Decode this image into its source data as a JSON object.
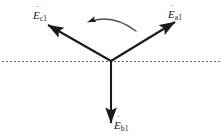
{
  "figure": {
    "width": 222,
    "height": 140,
    "background_color": "#ffffff",
    "stroke_color": "#1a1a1a",
    "dashed_line_color": "#6b6b6b"
  },
  "origin": {
    "x": 111,
    "y": 61
  },
  "reference_line": {
    "name": "horizontal-dashed-axis",
    "x1": 2,
    "x2": 220,
    "y": 61,
    "dash": "2 2"
  },
  "rotation_arrow": {
    "name": "counter-clockwise-rotation-arrow",
    "direction": "counter-clockwise",
    "path": "M 136 31 Q 112 13 88 22",
    "arrow_at": {
      "x": 88,
      "y": 22
    }
  },
  "vectors": [
    {
      "id": "a1",
      "symbol": "E",
      "accent": "˙",
      "subscript": "a1",
      "label": "Ėa1",
      "tip": {
        "x": 175,
        "y": 22
      },
      "angle_deg": 30
    },
    {
      "id": "c1",
      "symbol": "E",
      "accent": "˙",
      "subscript": "c1",
      "label": "Ėc1",
      "tip": {
        "x": 48,
        "y": 25
      },
      "angle_deg": 150
    },
    {
      "id": "b1",
      "symbol": "E",
      "accent": "˙",
      "subscript": "b1",
      "label": "Ėb1",
      "tip": {
        "x": 111,
        "y": 123
      },
      "angle_deg": 270
    }
  ]
}
